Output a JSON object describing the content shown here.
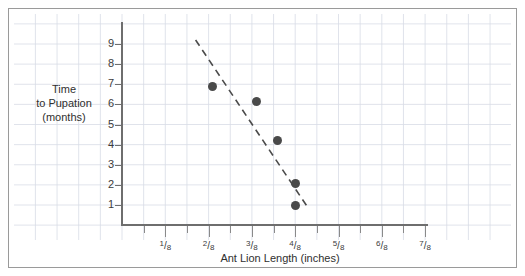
{
  "chart_data": {
    "type": "scatter",
    "title": "",
    "xlabel": "Ant Lion Length (inches)",
    "ylabel": "Time to Pupation (months)",
    "ylabel_lines": [
      "Time",
      "to Pupation",
      "(months)"
    ],
    "xlim": [
      0,
      1
    ],
    "ylim": [
      0,
      9.8
    ],
    "grid": true,
    "legend": "none",
    "x_tick_labels": [
      "1/8",
      "2/8",
      "3/8",
      "4/8",
      "5/8",
      "6/8",
      "7/8"
    ],
    "x_tick_values": [
      0.125,
      0.25,
      0.375,
      0.5,
      0.625,
      0.75,
      0.875
    ],
    "x_tick_fractions": [
      {
        "num": "1",
        "den": "8"
      },
      {
        "num": "2",
        "den": "8"
      },
      {
        "num": "3",
        "den": "8"
      },
      {
        "num": "4",
        "den": "8"
      },
      {
        "num": "5",
        "den": "8"
      },
      {
        "num": "6",
        "den": "8"
      },
      {
        "num": "7",
        "den": "8"
      }
    ],
    "y_tick_labels": [
      "1",
      "2",
      "3",
      "4",
      "5",
      "6",
      "7",
      "8",
      "9"
    ],
    "y_tick_values": [
      1,
      2,
      3,
      4,
      5,
      6,
      7,
      8,
      9
    ],
    "points": [
      {
        "x": 0.2625,
        "y": 6.9,
        "x_label": "2.1/8"
      },
      {
        "x": 0.3875,
        "y": 6.15,
        "x_label": "3.1/8"
      },
      {
        "x": 0.45,
        "y": 4.2,
        "x_label": "3.6/8"
      },
      {
        "x": 0.5,
        "y": 2.05,
        "x_label": "4/8"
      },
      {
        "x": 0.5,
        "y": 1.0,
        "x_label": "4/8"
      }
    ],
    "trend_line": {
      "style": "dashed",
      "x1": 0.2125,
      "y1": 9.2,
      "x2": 0.5375,
      "y2": 0.85
    },
    "colors": {
      "point": "#4a4a4a",
      "trend": "#4a4a4a",
      "axis": "#6e6e6e",
      "grid": "#d8dce6",
      "frame": "#9a9a9a",
      "text": "#2f2f2f",
      "background": "#ffffff"
    }
  }
}
